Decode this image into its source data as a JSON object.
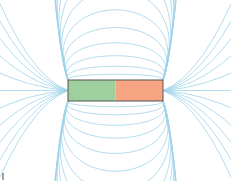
{
  "diagram": {
    "type": "bar-magnet-field-lines",
    "colors": {
      "field_line": "#9fd3ea",
      "north_half": "#9ecf9f",
      "south_half": "#f7a483",
      "outline": "#555555"
    },
    "magnet": {
      "x": 68,
      "y": 80,
      "width": 95,
      "height": 21
    }
  }
}
